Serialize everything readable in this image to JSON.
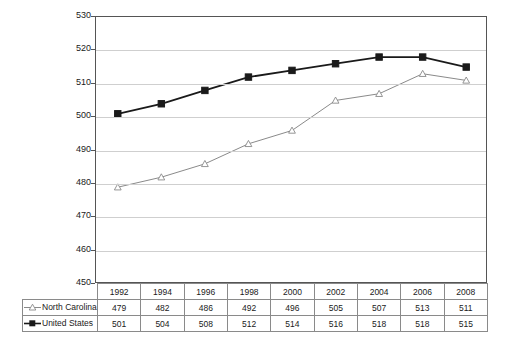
{
  "chart_data": {
    "type": "line",
    "title": "",
    "xlabel": "",
    "ylabel": "",
    "ylim": [
      450,
      530
    ],
    "ytick_step": 10,
    "yticks": [
      530,
      520,
      510,
      500,
      490,
      480,
      470,
      460,
      450
    ],
    "grid": true,
    "legend_position": "table-left",
    "categories": [
      "1992",
      "1994",
      "1996",
      "1998",
      "2000",
      "2002",
      "2004",
      "2006",
      "2008"
    ],
    "series": [
      {
        "name": "North Carolina",
        "marker": "open-triangle",
        "color": "#8a8a8a",
        "values": [
          479,
          482,
          486,
          492,
          496,
          505,
          507,
          513,
          511
        ]
      },
      {
        "name": "United States",
        "marker": "filled-square",
        "color": "#1a1a1a",
        "values": [
          501,
          504,
          508,
          512,
          514,
          516,
          518,
          518,
          515
        ]
      }
    ]
  },
  "colors": {
    "north_carolina": "#8a8a8a",
    "united_states": "#1a1a1a",
    "gridline": "#cfcfcf",
    "axis": "#555555",
    "table_border": "#8a8a8a",
    "background": "#ffffff"
  }
}
